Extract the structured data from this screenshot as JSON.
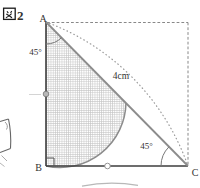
{
  "figure_label": {
    "full": "図2",
    "kanji": "図",
    "number": "2"
  },
  "vertex_labels": {
    "a": "A",
    "b": "B",
    "c": "C"
  },
  "angle_labels": {
    "at_a": "45°",
    "at_c": "45°"
  },
  "length_labels": {
    "arc_label": "4cm"
  },
  "colors": {
    "background": "#ffffff",
    "solid_line": "#3d3d3d",
    "diagonal_line": "#8c8c8c",
    "dashed_square": "#888888",
    "dotted_arc": "#9a9a9a",
    "hatch": "#c4c4c4",
    "text": "#333333"
  }
}
